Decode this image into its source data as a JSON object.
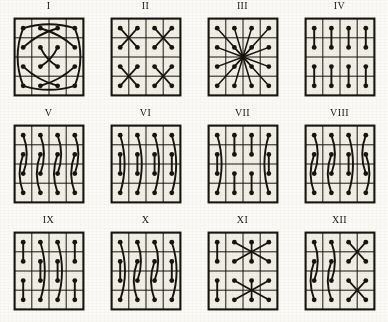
{
  "figure": {
    "kind": "plate-of-diagrams",
    "background_color": "#fbfaf6",
    "ink_color": "#16140f",
    "cell_fill_color": "#f2efe6",
    "grid": {
      "rows": 4,
      "cols": 4,
      "dots": 16
    },
    "layout": {
      "rows": 3,
      "cols": 4,
      "panel_count": 12
    }
  },
  "panels": [
    {
      "label": "I",
      "name": "panel-i",
      "pattern": "crossed-diamond-lattice",
      "x": 0,
      "y": 0,
      "links": [
        {
          "type": "arc",
          "from": [
            0,
            0
          ],
          "to": [
            3,
            0
          ],
          "bow": 14
        },
        {
          "type": "arc",
          "from": [
            0,
            3
          ],
          "to": [
            3,
            3
          ],
          "bow": -14
        },
        {
          "type": "arc",
          "from": [
            0,
            0
          ],
          "to": [
            0,
            3
          ],
          "bow": -10
        },
        {
          "type": "arc",
          "from": [
            3,
            0
          ],
          "to": [
            3,
            3
          ],
          "bow": 10
        },
        {
          "type": "arc",
          "from": [
            1,
            0
          ],
          "to": [
            0,
            2
          ],
          "bow": -6
        },
        {
          "type": "arc",
          "from": [
            1,
            3
          ],
          "to": [
            0,
            1
          ],
          "bow": 6
        },
        {
          "type": "arc",
          "from": [
            2,
            0
          ],
          "to": [
            3,
            2
          ],
          "bow": 6
        },
        {
          "type": "arc",
          "from": [
            2,
            3
          ],
          "to": [
            3,
            1
          ],
          "bow": -6
        },
        {
          "type": "arc",
          "from": [
            1,
            1
          ],
          "to": [
            2,
            2
          ],
          "bow": 5
        },
        {
          "type": "arc",
          "from": [
            1,
            2
          ],
          "to": [
            2,
            1
          ],
          "bow": -5
        }
      ]
    },
    {
      "label": "II",
      "name": "panel-ii",
      "pattern": "four-x-stars",
      "x": 1,
      "y": 0,
      "links": [
        {
          "type": "x-star",
          "block": [
            0,
            0
          ]
        },
        {
          "type": "x-star",
          "block": [
            0,
            2
          ]
        },
        {
          "type": "x-star",
          "block": [
            2,
            0
          ]
        },
        {
          "type": "x-star",
          "block": [
            2,
            2
          ]
        }
      ]
    },
    {
      "label": "III",
      "name": "panel-iii",
      "pattern": "radial-star-to-center",
      "x": 2,
      "y": 0,
      "links": [
        {
          "type": "radial",
          "center": [
            1.5,
            1.5
          ],
          "all_dots": true
        }
      ]
    },
    {
      "label": "IV",
      "name": "panel-iv",
      "pattern": "eight-vertical-dumbbells",
      "x": 3,
      "y": 0,
      "links": [
        {
          "type": "bar",
          "from": [
            0,
            0
          ],
          "to": [
            1,
            0
          ]
        },
        {
          "type": "bar",
          "from": [
            0,
            1
          ],
          "to": [
            1,
            1
          ]
        },
        {
          "type": "bar",
          "from": [
            0,
            2
          ],
          "to": [
            1,
            2
          ]
        },
        {
          "type": "bar",
          "from": [
            0,
            3
          ],
          "to": [
            1,
            3
          ]
        },
        {
          "type": "bar",
          "from": [
            2,
            0
          ],
          "to": [
            3,
            0
          ]
        },
        {
          "type": "bar",
          "from": [
            2,
            1
          ],
          "to": [
            3,
            1
          ]
        },
        {
          "type": "bar",
          "from": [
            2,
            2
          ],
          "to": [
            3,
            2
          ]
        },
        {
          "type": "bar",
          "from": [
            2,
            3
          ],
          "to": [
            3,
            3
          ]
        }
      ]
    },
    {
      "label": "V",
      "name": "panel-v",
      "pattern": "four-s-curve-columns",
      "x": 0,
      "y": 1,
      "links": [
        {
          "type": "arc",
          "from": [
            0,
            0
          ],
          "to": [
            2,
            0
          ],
          "bow": -9
        },
        {
          "type": "arc",
          "from": [
            1,
            0
          ],
          "to": [
            3,
            0
          ],
          "bow": 9
        },
        {
          "type": "arc",
          "from": [
            0,
            1
          ],
          "to": [
            2,
            1
          ],
          "bow": -9
        },
        {
          "type": "arc",
          "from": [
            1,
            1
          ],
          "to": [
            3,
            1
          ],
          "bow": 9
        },
        {
          "type": "arc",
          "from": [
            0,
            2
          ],
          "to": [
            2,
            2
          ],
          "bow": -9
        },
        {
          "type": "arc",
          "from": [
            1,
            2
          ],
          "to": [
            3,
            2
          ],
          "bow": 9
        },
        {
          "type": "arc",
          "from": [
            0,
            3
          ],
          "to": [
            2,
            3
          ],
          "bow": -9
        },
        {
          "type": "arc",
          "from": [
            1,
            3
          ],
          "to": [
            3,
            3
          ],
          "bow": 9
        }
      ]
    },
    {
      "label": "VI",
      "name": "panel-vi",
      "pattern": "long-arc-plus-short-middle",
      "x": 1,
      "y": 1,
      "links": [
        {
          "type": "arc",
          "from": [
            0,
            0
          ],
          "to": [
            3,
            0
          ],
          "bow": -11
        },
        {
          "type": "bar",
          "from": [
            1,
            0
          ],
          "to": [
            2,
            0
          ]
        },
        {
          "type": "arc",
          "from": [
            0,
            1
          ],
          "to": [
            3,
            1
          ],
          "bow": -11
        },
        {
          "type": "bar",
          "from": [
            1,
            1
          ],
          "to": [
            2,
            1
          ]
        },
        {
          "type": "arc",
          "from": [
            0,
            2
          ],
          "to": [
            3,
            2
          ],
          "bow": -11
        },
        {
          "type": "bar",
          "from": [
            1,
            2
          ],
          "to": [
            2,
            2
          ]
        },
        {
          "type": "arc",
          "from": [
            0,
            3
          ],
          "to": [
            3,
            3
          ],
          "bow": -11
        },
        {
          "type": "bar",
          "from": [
            1,
            3
          ],
          "to": [
            2,
            3
          ]
        }
      ]
    },
    {
      "label": "VII",
      "name": "panel-vii",
      "pattern": "outer-arcs-inner-dumbbells",
      "x": 2,
      "y": 1,
      "links": [
        {
          "type": "arc",
          "from": [
            0,
            0
          ],
          "to": [
            3,
            0
          ],
          "bow": -11
        },
        {
          "type": "bar",
          "from": [
            1,
            0
          ],
          "to": [
            2,
            0
          ]
        },
        {
          "type": "arc",
          "from": [
            0,
            3
          ],
          "to": [
            3,
            3
          ],
          "bow": 11
        },
        {
          "type": "bar",
          "from": [
            1,
            3
          ],
          "to": [
            2,
            3
          ]
        },
        {
          "type": "bar",
          "from": [
            0,
            1
          ],
          "to": [
            1,
            1
          ]
        },
        {
          "type": "bar",
          "from": [
            2,
            1
          ],
          "to": [
            3,
            1
          ]
        },
        {
          "type": "bar",
          "from": [
            0,
            2
          ],
          "to": [
            1,
            2
          ]
        },
        {
          "type": "bar",
          "from": [
            2,
            2
          ],
          "to": [
            3,
            2
          ]
        }
      ]
    },
    {
      "label": "VIII",
      "name": "panel-viii",
      "pattern": "mixed-arc-columns",
      "x": 3,
      "y": 1,
      "links": [
        {
          "type": "arc",
          "from": [
            0,
            0
          ],
          "to": [
            2,
            0
          ],
          "bow": -9
        },
        {
          "type": "arc",
          "from": [
            1,
            0
          ],
          "to": [
            3,
            0
          ],
          "bow": 9
        },
        {
          "type": "arc",
          "from": [
            0,
            1
          ],
          "to": [
            2,
            1
          ],
          "bow": -9
        },
        {
          "type": "arc",
          "from": [
            1,
            1
          ],
          "to": [
            3,
            1
          ],
          "bow": 9
        },
        {
          "type": "arc",
          "from": [
            0,
            2
          ],
          "to": [
            3,
            2
          ],
          "bow": -11
        },
        {
          "type": "bar",
          "from": [
            1,
            2
          ],
          "to": [
            2,
            2
          ]
        },
        {
          "type": "arc",
          "from": [
            0,
            3
          ],
          "to": [
            2,
            3
          ],
          "bow": 9
        },
        {
          "type": "arc",
          "from": [
            1,
            3
          ],
          "to": [
            3,
            3
          ],
          "bow": -9
        }
      ]
    },
    {
      "label": "IX",
      "name": "panel-ix",
      "pattern": "outer-dumbbells-inner-arcs",
      "x": 0,
      "y": 2,
      "links": [
        {
          "type": "bar",
          "from": [
            0,
            0
          ],
          "to": [
            1,
            0
          ]
        },
        {
          "type": "bar",
          "from": [
            2,
            0
          ],
          "to": [
            3,
            0
          ]
        },
        {
          "type": "bar",
          "from": [
            0,
            3
          ],
          "to": [
            1,
            3
          ]
        },
        {
          "type": "bar",
          "from": [
            2,
            3
          ],
          "to": [
            3,
            3
          ]
        },
        {
          "type": "arc",
          "from": [
            0,
            1
          ],
          "to": [
            3,
            1
          ],
          "bow": -11
        },
        {
          "type": "bar",
          "from": [
            1,
            1
          ],
          "to": [
            2,
            1
          ]
        },
        {
          "type": "arc",
          "from": [
            0,
            2
          ],
          "to": [
            3,
            2
          ],
          "bow": -11
        },
        {
          "type": "bar",
          "from": [
            1,
            2
          ],
          "to": [
            2,
            2
          ]
        }
      ]
    },
    {
      "label": "X",
      "name": "panel-x",
      "pattern": "all-columns-long-arcs",
      "x": 1,
      "y": 2,
      "links": [
        {
          "type": "arc",
          "from": [
            0,
            0
          ],
          "to": [
            3,
            0
          ],
          "bow": -12
        },
        {
          "type": "bar",
          "from": [
            1,
            0
          ],
          "to": [
            2,
            0
          ]
        },
        {
          "type": "arc",
          "from": [
            0,
            1
          ],
          "to": [
            2,
            1
          ],
          "bow": -9
        },
        {
          "type": "arc",
          "from": [
            1,
            1
          ],
          "to": [
            3,
            1
          ],
          "bow": 9
        },
        {
          "type": "arc",
          "from": [
            0,
            2
          ],
          "to": [
            2,
            2
          ],
          "bow": -9
        },
        {
          "type": "arc",
          "from": [
            1,
            2
          ],
          "to": [
            3,
            2
          ],
          "bow": 9
        },
        {
          "type": "arc",
          "from": [
            0,
            3
          ],
          "to": [
            3,
            3
          ],
          "bow": -12
        },
        {
          "type": "bar",
          "from": [
            1,
            3
          ],
          "to": [
            2,
            3
          ]
        }
      ]
    },
    {
      "label": "XI",
      "name": "panel-xi",
      "pattern": "column-dumbbells-plus-two-x-stars",
      "x": 2,
      "y": 2,
      "links": [
        {
          "type": "bar",
          "from": [
            0,
            0
          ],
          "to": [
            1,
            0
          ]
        },
        {
          "type": "bar",
          "from": [
            2,
            0
          ],
          "to": [
            3,
            0
          ]
        },
        {
          "type": "x-star-wide",
          "block": [
            0,
            1
          ]
        },
        {
          "type": "x-star-wide",
          "block": [
            2,
            1
          ]
        }
      ]
    },
    {
      "label": "XII",
      "name": "panel-xii",
      "pattern": "arc-columns-plus-x-stars",
      "x": 3,
      "y": 2,
      "links": [
        {
          "type": "arc",
          "from": [
            0,
            0
          ],
          "to": [
            2,
            0
          ],
          "bow": -9
        },
        {
          "type": "arc",
          "from": [
            1,
            0
          ],
          "to": [
            3,
            0
          ],
          "bow": 9
        },
        {
          "type": "arc",
          "from": [
            0,
            1
          ],
          "to": [
            2,
            1
          ],
          "bow": -9
        },
        {
          "type": "arc",
          "from": [
            1,
            1
          ],
          "to": [
            3,
            1
          ],
          "bow": 9
        },
        {
          "type": "x-star",
          "block": [
            0,
            2
          ]
        },
        {
          "type": "x-star",
          "block": [
            2,
            2
          ]
        }
      ]
    }
  ]
}
